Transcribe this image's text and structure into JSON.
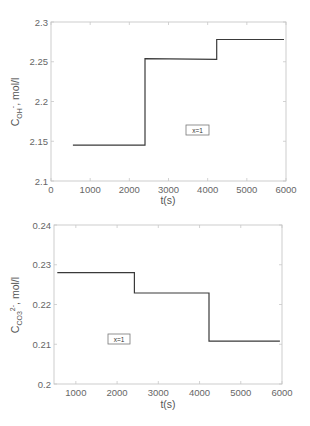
{
  "chart_data": [
    {
      "type": "line",
      "title": "",
      "xlabel": "t(s)",
      "ylabel": "C_OH-, mol/l",
      "ylabel_main": "C",
      "ylabel_sub": "OH",
      "ylabel_sup": "-",
      "ylabel_unit": ", mol/l",
      "xlim": [
        0,
        6000
      ],
      "ylim": [
        2.1,
        2.3
      ],
      "xticks": [
        0,
        1000,
        2000,
        3000,
        4000,
        5000,
        6000
      ],
      "xtick_labels": [
        "0",
        "1000",
        "2000",
        "3000",
        "4000",
        "5000",
        "6000"
      ],
      "yticks": [
        2.1,
        2.15,
        2.2,
        2.25,
        2.3
      ],
      "ytick_labels": [
        "2.1",
        "2.15",
        "2.2",
        "2.25",
        "2.3"
      ],
      "grid": false,
      "annotation": "x=1",
      "series": [
        {
          "name": "C_OH-",
          "step": true,
          "x": [
            560,
            2400,
            2400,
            4230,
            4230,
            5950
          ],
          "y": [
            2.145,
            2.145,
            2.254,
            2.253,
            2.278,
            2.278
          ]
        }
      ]
    },
    {
      "type": "line",
      "title": "",
      "xlabel": "t(s)",
      "ylabel": "C_CO3 2-, mol/l",
      "ylabel_main": "C",
      "ylabel_sub": "CO3",
      "ylabel_sup": "2-",
      "ylabel_unit": ", mol/l",
      "xlim": [
        470,
        6000
      ],
      "ylim": [
        0.2,
        0.24
      ],
      "xticks": [
        1000,
        2000,
        3000,
        4000,
        5000,
        6000
      ],
      "xtick_labels": [
        "1000",
        "2000",
        "3000",
        "4000",
        "5000",
        "6000"
      ],
      "yticks": [
        0.2,
        0.21,
        0.22,
        0.23,
        0.24
      ],
      "ytick_labels": [
        "0.2",
        "0.21",
        "0.22",
        "0.23",
        "0.24"
      ],
      "grid": false,
      "annotation": "x=1",
      "series": [
        {
          "name": "C_CO3 2-",
          "step": true,
          "x": [
            550,
            2420,
            2420,
            4230,
            4230,
            5950
          ],
          "y": [
            0.228,
            0.228,
            0.2229,
            0.2229,
            0.2108,
            0.2108
          ]
        }
      ]
    }
  ]
}
